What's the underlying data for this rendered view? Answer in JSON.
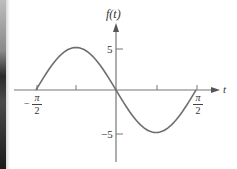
{
  "chart_data": {
    "type": "line",
    "title": "",
    "xlabel": "t",
    "ylabel": "f(t)",
    "function": "f(t) = -5 sin(2t)",
    "x_range": [
      -1.5708,
      1.5708
    ],
    "xlim_labels": [
      "-π/2",
      "π/2"
    ],
    "ylim": [
      -5,
      5
    ],
    "x_ticks": [
      {
        "value": -1.5708,
        "label": "-π/2"
      },
      {
        "value": -0.7854,
        "label": ""
      },
      {
        "value": 0.7854,
        "label": ""
      },
      {
        "value": 1.5708,
        "label": "π/2"
      }
    ],
    "y_ticks": [
      {
        "value": 5,
        "label": "5"
      },
      {
        "value": -5,
        "label": "-5"
      }
    ],
    "series": [
      {
        "name": "f(t)",
        "x": [
          -1.5708,
          -1.1781,
          -0.7854,
          -0.3927,
          0,
          0.3927,
          0.7854,
          1.1781,
          1.5708
        ],
        "values": [
          0,
          3.54,
          5,
          3.54,
          0,
          -3.54,
          -5,
          -3.54,
          0
        ]
      }
    ],
    "grid": false,
    "legend": "none",
    "key_points": {
      "max": {
        "t": "-π/4",
        "value": 5
      },
      "min": {
        "t": "π/4",
        "value": -5
      },
      "zeros": [
        "-π/2",
        "0",
        "π/2"
      ]
    }
  },
  "labels": {
    "y_axis": "f(t)",
    "x_axis": "t",
    "y_tick_pos": "5",
    "y_tick_neg": "−5",
    "x_left_num": "π",
    "x_left_den": "2",
    "x_left_sign": "−",
    "x_right_num": "π",
    "x_right_den": "2"
  },
  "colors": {
    "curve": "#6e6e6e",
    "axes": "#777777",
    "text": "#333333"
  }
}
